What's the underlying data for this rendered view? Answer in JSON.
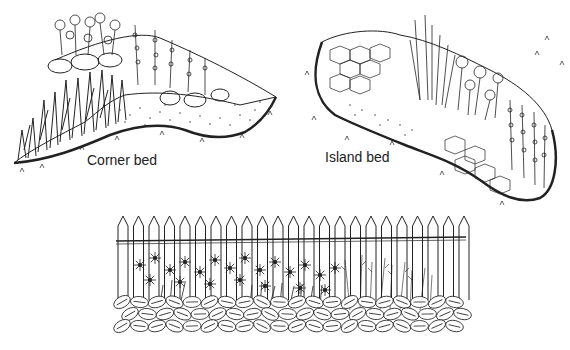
{
  "figure": {
    "panels": [
      {
        "id": "corner",
        "label": "Corner bed"
      },
      {
        "id": "island",
        "label": "Island bed"
      },
      {
        "id": "border",
        "label": ""
      }
    ],
    "colors": {
      "ink": "#222222",
      "background": "#ffffff"
    }
  }
}
